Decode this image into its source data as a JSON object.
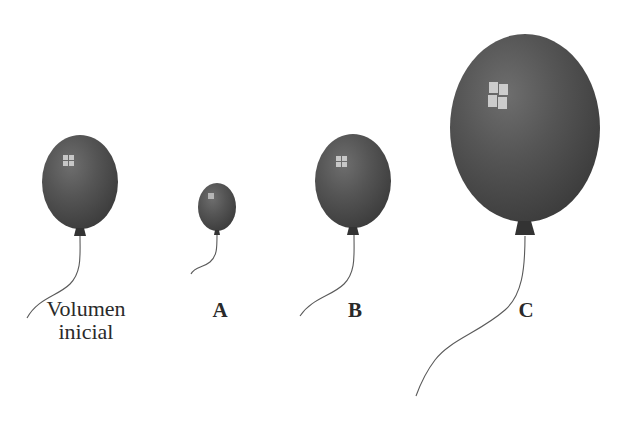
{
  "diagram": {
    "type": "balloon-volume-comparison",
    "background": "#ffffff",
    "balloon_color": "#4a4a4a",
    "balloon_highlight": "#7a7a7a",
    "knot_color": "#333333",
    "string_color": "#555555",
    "balloons": [
      {
        "id": "initial",
        "label_line1": "Volumen",
        "label_line2": "inicial",
        "cx": 80,
        "cy": 182,
        "rx": 38,
        "ry": 47,
        "knot_y": 229,
        "string_path": "M80,236 C80,255 82,272 70,284 C58,296 38,298 27,318"
      },
      {
        "id": "A",
        "label": "A",
        "cx": 217,
        "cy": 207,
        "rx": 19,
        "ry": 24,
        "knot_y": 231,
        "string_path": "M217,235 C217,248 217,256 210,262 C203,268 195,266 191,274"
      },
      {
        "id": "B",
        "label": "B",
        "cx": 353,
        "cy": 181,
        "rx": 38,
        "ry": 47,
        "knot_y": 228,
        "string_path": "M354,235 C354,255 356,272 344,284 C332,296 312,298 300,316"
      },
      {
        "id": "C",
        "label": "C",
        "cx": 525,
        "cy": 128,
        "rx": 75,
        "ry": 94,
        "knot_y": 222,
        "string_path": "M525,236 C525,270 522,295 505,310 C480,332 450,340 435,360 C425,373 420,385 416,396"
      }
    ]
  }
}
